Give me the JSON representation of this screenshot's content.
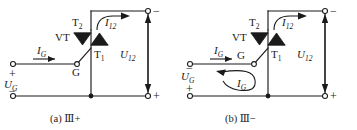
{
  "figure": {
    "type": "circuit-diagram-pair"
  },
  "panels": [
    {
      "id": "a",
      "caption": "(a) Ⅲ+",
      "caption_prefix": "(a)",
      "caption_mode": "Ⅲ+",
      "device_label": "VT",
      "terminal_top_label": "T",
      "terminal_top_sub": "2",
      "terminal_bottom_label": "T",
      "terminal_bottom_sub": "1",
      "gate_label": "G",
      "gate_current_label": "I",
      "gate_current_sub": "G",
      "main_current_label": "I",
      "main_current_sub": "12",
      "main_voltage_label": "U",
      "main_voltage_sub": "12",
      "source_label": "U",
      "source_sub": "G",
      "source_top_sign": "+",
      "source_bottom_sign": "−",
      "load_top_sign": "−",
      "load_bottom_sign": "+",
      "has_loop_arrow": false,
      "has_straight_gate_arrow": true
    },
    {
      "id": "b",
      "caption": "(b) Ⅲ−",
      "caption_prefix": "(b)",
      "caption_mode": "Ⅲ−",
      "device_label": "VT",
      "terminal_top_label": "T",
      "terminal_top_sub": "2",
      "terminal_bottom_label": "T",
      "terminal_bottom_sub": "1",
      "gate_label": "G",
      "gate_current_label": "I",
      "gate_current_sub": "G",
      "loop_current_label": "I",
      "loop_current_sub": "G",
      "main_current_label": "I",
      "main_current_sub": "12",
      "main_voltage_label": "U",
      "main_voltage_sub": "12",
      "source_label": "U",
      "source_sub": "G",
      "source_top_sign": "−",
      "source_bottom_sign": "+",
      "load_top_sign": "−",
      "load_bottom_sign": "+",
      "has_loop_arrow": true,
      "has_straight_gate_arrow": true
    }
  ],
  "colors": {
    "ink": "#1a1a1a",
    "background": "#ffffff"
  }
}
